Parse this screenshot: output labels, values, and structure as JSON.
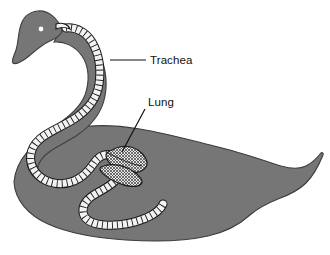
{
  "figure": {
    "kind": "anatomical-diagram",
    "background_color": "#ffffff",
    "body_color": "#767676",
    "body_outline_color": "#3d3d3d",
    "trachea_fill": "#f2f2f2",
    "trachea_outline": "#1a1a1a",
    "lung_fill": "#dcdcdc",
    "lung_outline": "#1a1a1a",
    "label_color": "#111111",
    "leader_line_color": "#111111"
  },
  "labels": {
    "trachea": {
      "text": "Trachea",
      "x": 150,
      "y": 64,
      "leader": "horizontal"
    },
    "lung": {
      "text": "Lung",
      "x": 148,
      "y": 106,
      "leader": "diagonal"
    }
  },
  "parts": {
    "body": "swan-body-silhouette",
    "head": "swan-head",
    "eye": "swan-eye",
    "beak": "swan-beak",
    "tail": "swan-tail",
    "trachea": "coiled-trachea",
    "lung": "lung-organ"
  }
}
